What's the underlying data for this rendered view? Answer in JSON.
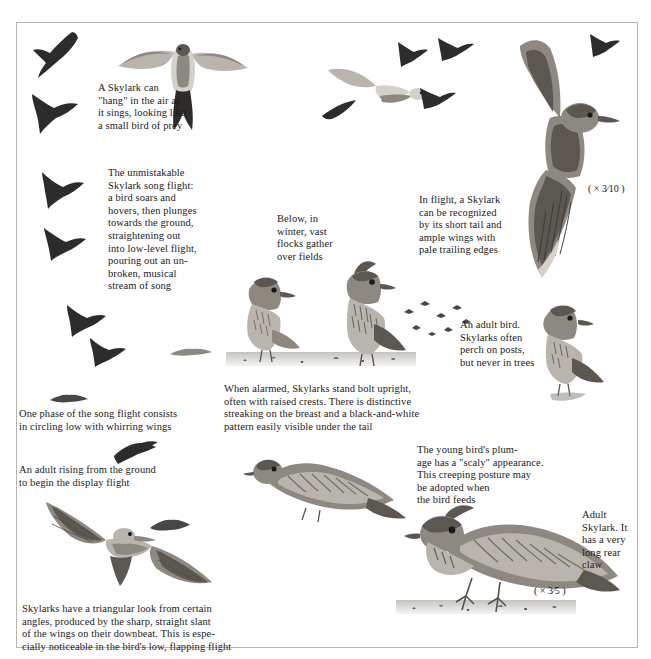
{
  "page": {
    "subject": "Skylark",
    "plate_type": "field-guide-illustration-plate"
  },
  "captions": {
    "hang_in_air": "A Skylark can\n\"hang\" in the air as\nit sings, looking like\na small bird of prey",
    "song_flight": "The unmistakable\nSkylark song flight:\na bird soars and\nhovers, then plunges\ntowards the ground,\nstraightening out\ninto low-level flight,\npouring out an un-\nbroken, musical\nstream of song",
    "winter_flocks": "Below, in\nwinter, vast\nflocks gather\nover fields",
    "in_flight": "In flight, a Skylark\ncan be recognized\nby its short tail and\nample wings with\npale trailing edges",
    "adult_bird_perch": "An adult bird.\nSkylarks often\nperch on posts,\nbut never in trees",
    "when_alarmed": "When alarmed, Skylarks stand bolt upright,\noften with raised crests. There is distinctive\nstreaking on the breast and a black-and-white\npattern easily visible under the tail",
    "circling_low": "One phase of the song flight consists\nin circling low with whirring wings",
    "adult_rising": "An adult rising from the ground\nto begin the display flight",
    "young_bird": "The young bird's plum-\nage has a \"scaly\" appearance.\nThis creeping posture may\nbe adopted when\nthe bird feeds",
    "adult_skylark": "Adult\nSkylark. It\nhas a very\nlong rear\nclaw",
    "triangular_look": "Skylarks have a triangular look from certain\nangles, produced by the sharp, straight slant\nof the wings on their downbeat. This is espe-\ncially noticeable in the bird's low, flapping flight"
  },
  "scales": {
    "flight_scale": "( ×  3⁄10 )",
    "adult_scale": "( ×  3⁄5 )"
  },
  "colors": {
    "page_background": "#ffffff",
    "frame_border": "#b9b4ac",
    "text": "#1a1a1a",
    "silhouette": "#2e2c2a",
    "plumage_mid": "#8d8880",
    "plumage_pale": "#b9b4ae"
  }
}
